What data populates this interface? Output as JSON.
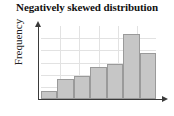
{
  "chart_data": {
    "type": "bar",
    "title": "Negatively skewed distribution",
    "xlabel": "",
    "ylabel": "Frequency",
    "categories": [
      "1",
      "2",
      "3",
      "4",
      "5",
      "6",
      "7"
    ],
    "values": [
      8,
      21,
      24,
      33,
      36,
      68,
      48
    ],
    "ylim": [
      0,
      76
    ],
    "grid": true,
    "grid_vertical_lines": 5,
    "grid_horizontal_lines": 5,
    "legend": null,
    "legend_position": "none",
    "bar_fill_color": "#c6c6c6",
    "bar_border_color": "#9a9a9a",
    "axis_color": "#3a3a3a",
    "grid_color": "#e2e2e2",
    "tick_labels_x": [],
    "tick_labels_y": [],
    "annotations": []
  },
  "axes": {
    "y_arrow_icon": "arrow-up-icon",
    "x_arrow_icon": "arrow-right-icon"
  }
}
